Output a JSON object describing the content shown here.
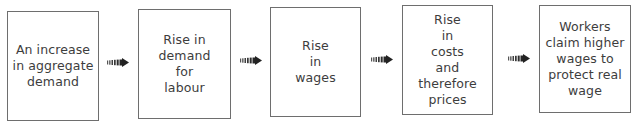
{
  "diagram": {
    "type": "flowchart",
    "direction": "left-to-right",
    "nodes": [
      {
        "id": "n1",
        "label": "An increase\nin aggregate\ndemand"
      },
      {
        "id": "n2",
        "label": "Rise in\ndemand\nfor\nlabour"
      },
      {
        "id": "n3",
        "label": "Rise\nin\nwages"
      },
      {
        "id": "n4",
        "label": "Rise\nin\ncosts\nand\ntherefore\nprices"
      },
      {
        "id": "n5",
        "label": "Workers\nclaim higher\nwages to\nprotect real\nwage"
      }
    ],
    "edges": [
      {
        "from": "n1",
        "to": "n2",
        "icon": "striped-arrow-icon"
      },
      {
        "from": "n2",
        "to": "n3",
        "icon": "striped-arrow-icon"
      },
      {
        "from": "n3",
        "to": "n4",
        "icon": "striped-arrow-icon"
      },
      {
        "from": "n4",
        "to": "n5",
        "icon": "striped-arrow-icon"
      }
    ],
    "colors": {
      "border": "#6e6e6e",
      "text": "#3d3d3d",
      "arrow": "#2a2a2a",
      "background": "#ffffff"
    }
  }
}
